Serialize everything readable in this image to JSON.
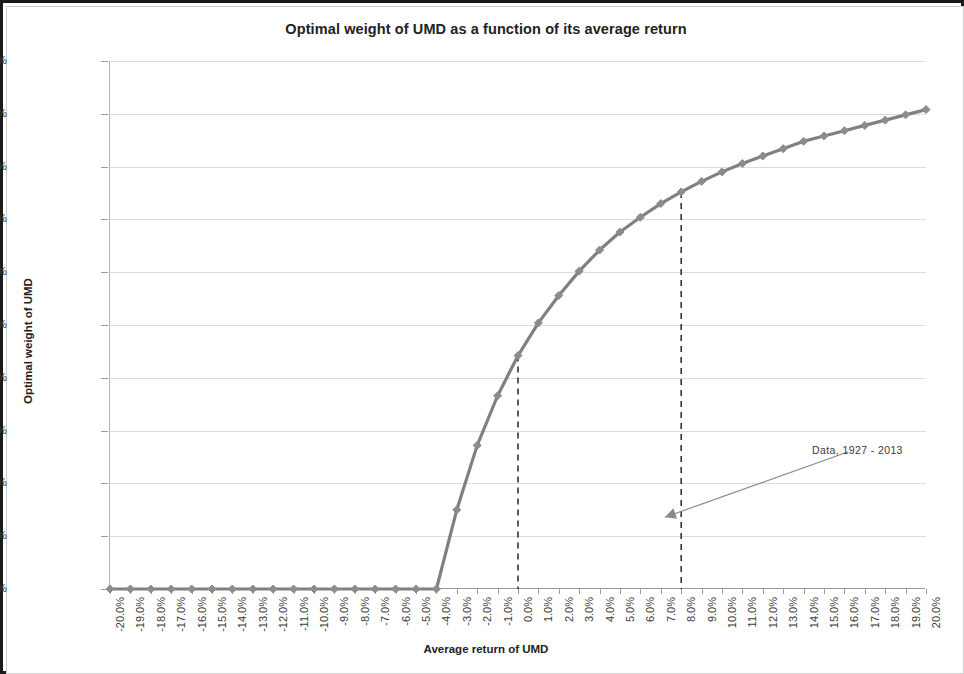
{
  "chart_data": {
    "type": "line",
    "title": "Optimal weight of UMD as a function of its average return",
    "xlabel": "Average return of UMD",
    "ylabel": "Optimal weight of UMD",
    "grid": true,
    "legend": "none",
    "xlim": [
      -20,
      20
    ],
    "ylim": [
      0,
      50
    ],
    "x_tick_labels": [
      "-20.0%",
      "-19.0%",
      "-18.0%",
      "-17.0%",
      "-16.0%",
      "-15.0%",
      "-14.0%",
      "-13.0%",
      "-12.0%",
      "-11.0%",
      "-10.0%",
      "-9.0%",
      "-8.0%",
      "-7.0%",
      "-6.0%",
      "-5.0%",
      "-4.0%",
      "-3.0%",
      "-2.0%",
      "-1.0%",
      "0.0%",
      "1.0%",
      "2.0%",
      "3.0%",
      "4.0%",
      "5.0%",
      "6.0%",
      "7.0%",
      "8.0%",
      "9.0%",
      "10.0%",
      "11.0%",
      "12.0%",
      "13.0%",
      "14.0%",
      "15.0%",
      "16.0%",
      "17.0%",
      "18.0%",
      "19.0%",
      "20.0%"
    ],
    "y_tick_labels": [
      "0.0%",
      "5.0%",
      "10.0%",
      "15.0%",
      "20.0%",
      "25.0%",
      "30.0%",
      "35.0%",
      "40.0%",
      "45.0%",
      "50.0%"
    ],
    "y_ticks": [
      0,
      5,
      10,
      15,
      20,
      25,
      30,
      35,
      40,
      45,
      50
    ],
    "x": [
      -20,
      -19,
      -18,
      -17,
      -16,
      -15,
      -14,
      -13,
      -12,
      -11,
      -10,
      -9,
      -8,
      -7,
      -6,
      -5,
      -4,
      -3,
      -2,
      -1,
      0,
      1,
      2,
      3,
      4,
      5,
      6,
      7,
      8,
      9,
      10,
      11,
      12,
      13,
      14,
      15,
      16,
      17,
      18,
      19,
      20
    ],
    "values": [
      0,
      0,
      0,
      0,
      0,
      0,
      0,
      0,
      0,
      0,
      0,
      0,
      0,
      0,
      0,
      0,
      0,
      7.5,
      13.6,
      18.3,
      22.1,
      25.2,
      27.8,
      30.1,
      32.1,
      33.8,
      35.2,
      36.5,
      37.6,
      38.6,
      39.5,
      40.3,
      41.0,
      41.7,
      42.4,
      42.9,
      43.4,
      43.9,
      44.4,
      44.9,
      45.4
    ],
    "series_name": "Optimal weight of UMD",
    "line_color": "#808080",
    "marker": "diamond",
    "marker_color": "#8c8c8c",
    "annotations": [
      {
        "text": "Data, 1927 - 2013",
        "arrow_from_x": 16.2,
        "arrow_from_y": 13.0,
        "arrow_to_x": 7.2,
        "arrow_to_y": 6.8
      }
    ],
    "reference_lines": [
      {
        "type": "vertical-dashed",
        "x": 0,
        "y_top": 22.1
      },
      {
        "type": "vertical-dashed",
        "x": 8,
        "y_top": 37.6
      }
    ]
  }
}
